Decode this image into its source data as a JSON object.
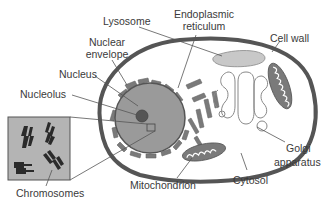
{
  "diagram": {
    "colors": {
      "cell_wall": "#555555",
      "cytosol": "#ffffff",
      "nucleus_fill": "#9a9a9a",
      "nucleolus_fill": "#555555",
      "organelle_fill": "#7a7a7a",
      "lysosome_fill": "#c8c8c8",
      "inset_fill": "#b4b4b4",
      "label_text": "#3a3a3a",
      "leader_line": "#555555"
    },
    "labels": {
      "lysosome": "Lysosome",
      "nuclear_envelope_1": "Nuclear",
      "nuclear_envelope_2": "envelope",
      "nucleus": "Nucleus",
      "nucleolus": "Nucleolus",
      "endoplasmic_reticulum_1": "Endoplasmic",
      "endoplasmic_reticulum_2": "reticulum",
      "cell_wall": "Cell wall",
      "golgi_1": "Golgi",
      "golgi_2": "apparatus",
      "cytosol": "Cytosol",
      "mitochondrion": "Mitochondrion",
      "chromosomes": "Chromosomes"
    }
  }
}
